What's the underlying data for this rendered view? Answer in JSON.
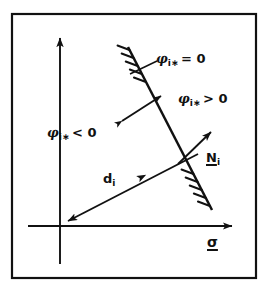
{
  "figure": {
    "background_color": "#ffffff",
    "ink_color": "#111111",
    "border": {
      "name": "figure-frame",
      "x": 12,
      "y": 14,
      "width": 244,
      "height": 264,
      "stroke_width": 2.2
    }
  },
  "axes": {
    "origin": {
      "x": 60,
      "y": 226
    },
    "horizontal": {
      "name": "stress-axis",
      "from_x": 28,
      "to_x": 238,
      "y": 226,
      "arrow": "right",
      "label": "σ",
      "label_style": "underlined-vector"
    },
    "vertical": {
      "name": "vertical-axis",
      "x": 60,
      "from_y": 264,
      "to_y": 32,
      "arrow": "up",
      "label": ""
    }
  },
  "yield_line": {
    "name": "yield-surface-line",
    "x1": 128,
    "y1": 47,
    "x2": 212,
    "y2": 210,
    "stroke_width": 2.4,
    "hatching": {
      "present": true,
      "side": "left",
      "segments": [
        "upper",
        "lower"
      ],
      "tick_count_upper": 5,
      "tick_count_lower": 5
    }
  },
  "distance_vector": {
    "name": "distance-vector-d",
    "from_x": 196,
    "from_y": 155,
    "to_x": 62,
    "to_y": 224,
    "arrow_at_origin": true,
    "midpoint_arrow": true,
    "label": "d",
    "subscript": "i"
  },
  "normal_vector": {
    "name": "normal-vector-N",
    "from_x": 178,
    "from_y": 164,
    "to_x": 216,
    "to_y": 127,
    "arrow": "up-right",
    "label": "N",
    "subscript": "i",
    "label_style": "underlined-vector"
  },
  "double_arrow": {
    "name": "gradient-direction-double-arrow",
    "from_x": 117,
    "from_y": 125,
    "to_x": 166,
    "to_y": 92,
    "heads": "both"
  },
  "leader_line": {
    "name": "yield-line-leader",
    "from_x": 130,
    "from_y": 73,
    "to_x": 156,
    "to_y": 60
  },
  "labels": {
    "phi_zero": {
      "name": "label-phi-equals-zero",
      "symbol": "φ",
      "subscript": "i∗",
      "relation": "= 0",
      "full_text": "φi∗ = 0"
    },
    "phi_positive": {
      "name": "label-phi-greater-zero",
      "symbol": "φ",
      "subscript": "i∗",
      "relation": "> 0",
      "full_text": "φi∗ > 0"
    },
    "phi_negative": {
      "name": "label-phi-less-zero",
      "symbol": "φ",
      "subscript": "i∗",
      "relation": "< 0",
      "full_text": "φi∗ < 0"
    },
    "normal": {
      "name": "label-normal-vector",
      "symbol": "N",
      "subscript": "i"
    },
    "distance": {
      "name": "label-distance-vector",
      "symbol": "d",
      "subscript": "i"
    },
    "sigma": {
      "name": "label-sigma",
      "symbol": "σ"
    }
  }
}
